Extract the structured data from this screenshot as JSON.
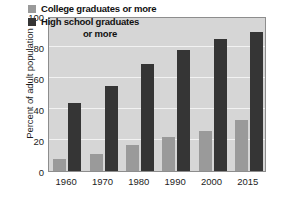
{
  "chart_data": {
    "type": "bar",
    "title": "",
    "xlabel": "",
    "ylabel": "Percent of adult population",
    "categories": [
      "1960",
      "1970",
      "1980",
      "1990",
      "2000",
      "2015"
    ],
    "series": [
      {
        "name": "College graduates or more",
        "color": "#9a9a9a",
        "values": [
          8,
          11,
          17,
          22,
          26,
          33
        ]
      },
      {
        "name": "High school graduates or more",
        "color": "#353535",
        "values": [
          44,
          55,
          69,
          78,
          85,
          90
        ]
      }
    ],
    "ylim": [
      0,
      100
    ],
    "y_ticks": [
      0,
      20,
      40,
      60,
      80,
      100
    ],
    "grid": true,
    "legend_position": "top-center",
    "plot_background": "#d6d6d6",
    "gridline_color": "#f2f2f2"
  },
  "legend": {
    "college_label": "College graduates or more",
    "highschool_label_line1": "High school graduates",
    "highschool_label_line2": "or more"
  }
}
